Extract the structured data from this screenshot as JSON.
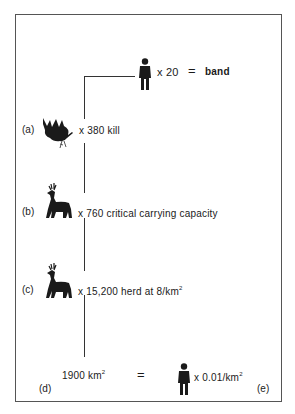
{
  "diagram": {
    "top": {
      "multiplier": "x 20",
      "equals": "=",
      "result": "band",
      "icon": "human-figure-icon"
    },
    "rows": [
      {
        "label": "(a)",
        "icon": "dead-deer-icon",
        "text": "x 380  kill"
      },
      {
        "label": "(b)",
        "icon": "deer-icon",
        "text": "x 760 critical carrying capacity"
      },
      {
        "label": "(c)",
        "icon": "deer-icon",
        "text_main": "x 15,200 herd at 8/km",
        "superscript": "2"
      }
    ],
    "bottom": {
      "left_label": "(d)",
      "area": "1900 km",
      "area_sup": "2",
      "equals": "=",
      "right_text": "x 0.01/km",
      "right_sup": "2",
      "right_label": "(e)",
      "icon": "human-figure-icon"
    },
    "colors": {
      "ink": "#1a1a1a",
      "line": "#333333",
      "frame": "#555555"
    }
  }
}
